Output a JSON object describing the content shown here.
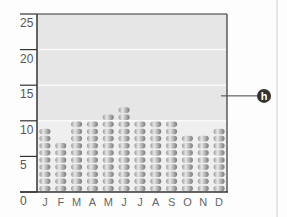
{
  "chart_data": {
    "type": "bar",
    "style": "stacked-disc pictogram",
    "title": "",
    "xlabel": "",
    "ylabel": "",
    "categories": [
      "J",
      "F",
      "M",
      "A",
      "M",
      "J",
      "J",
      "A",
      "S",
      "O",
      "N",
      "D"
    ],
    "values": [
      9,
      7,
      10,
      10,
      11,
      12,
      10,
      10,
      10,
      8,
      8,
      9
    ],
    "ylim": [
      0,
      25
    ],
    "yticks": [
      0,
      5,
      10,
      15,
      20,
      25
    ],
    "grid": true,
    "shaded_band": [
      10,
      25
    ],
    "annotation": {
      "label": "h",
      "value": 13.5
    }
  },
  "colors": {
    "plot_bg": "#efefef",
    "band_bg": "#e6e6e6",
    "axis": "#333333",
    "disc_dark": "#8a8a8a",
    "disc_light": "#e0e0e0",
    "marker": "#333333"
  }
}
